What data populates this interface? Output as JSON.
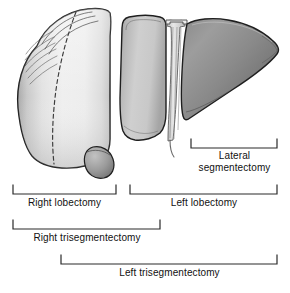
{
  "figure": {
    "type": "anatomical-illustration",
    "organ": "liver",
    "view": "anterior"
  },
  "anatomy": {
    "right_lobe": {
      "name": "right-lobe",
      "fill_light": "#f2f2f2",
      "fill_mid": "#d9d9d9",
      "fill_dark": "#a8a8a8",
      "stroke": "#1f1f1f"
    },
    "medial_segment": {
      "name": "medial-segment",
      "fill_light": "#d2d2d2",
      "fill_dark": "#9a9a9a",
      "stroke": "#1f1f1f"
    },
    "lateral_segment": {
      "name": "lateral-segment",
      "fill_light": "#9c9c9c",
      "fill_dark": "#6e6e6e",
      "stroke": "#1f1f1f"
    },
    "gallbladder": {
      "name": "gallbladder",
      "fill_light": "#b4b4b4",
      "fill_dark": "#7d7d7d",
      "stroke": "#1f1f1f"
    },
    "falciform_ligament": {
      "name": "falciform-ligament",
      "fill": "#d8d8d8",
      "stroke": "#6a6a6a"
    },
    "cantlie_line": {
      "name": "cantlie-dashed-line",
      "stroke": "#3a3a3a",
      "dash": "4 3"
    }
  },
  "brackets": [
    {
      "id": "lateral-segmentectomy",
      "label": "Lateral segmentectomy",
      "label_line1": "Lateral",
      "label_line2": "segmentectomy",
      "x_start": 191,
      "x_end": 277,
      "y": 148,
      "tick_height": 9
    },
    {
      "id": "right-lobectomy",
      "label": "Right lobectomy",
      "x_start": 13,
      "x_end": 116,
      "y": 194,
      "tick_height": 9
    },
    {
      "id": "left-lobectomy",
      "label": "Left lobectomy",
      "x_start": 130,
      "x_end": 277,
      "y": 194,
      "tick_height": 9
    },
    {
      "id": "right-trisegmentectomy",
      "label": "Right trisegmentectomy",
      "x_start": 13,
      "x_end": 160,
      "y": 229,
      "tick_height": 9
    },
    {
      "id": "left-trisegmentectomy",
      "label": "Left trisegmentectomy",
      "x_start": 61,
      "x_end": 277,
      "y": 264,
      "tick_height": 9
    }
  ],
  "colors": {
    "background": "#ffffff",
    "ink": "#111111",
    "bracket_stroke": "#2a2a2a"
  }
}
